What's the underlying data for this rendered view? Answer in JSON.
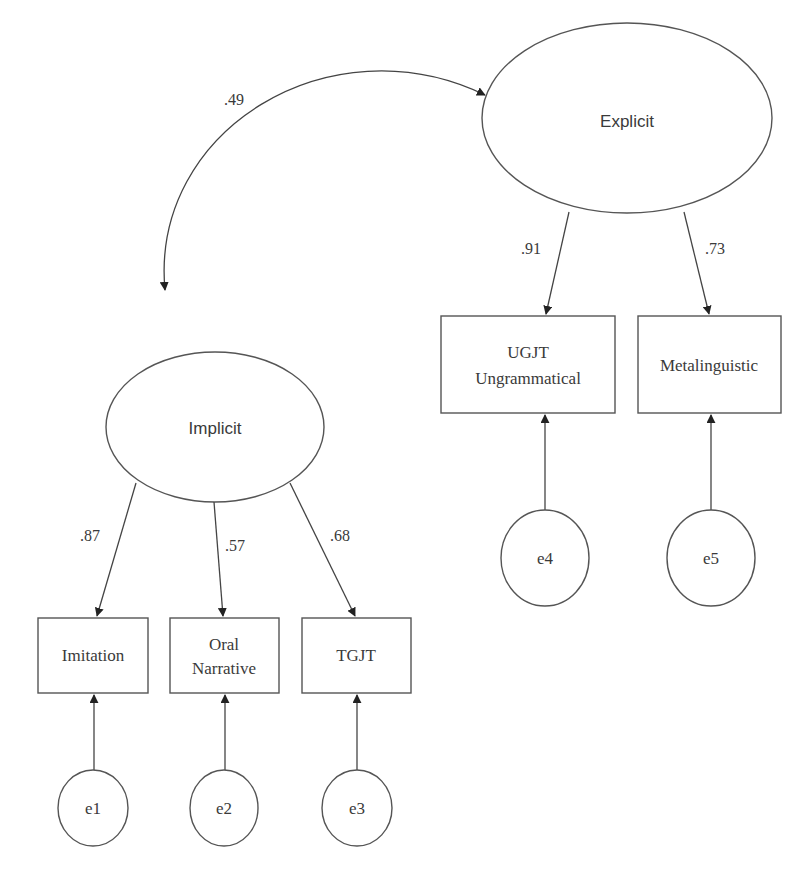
{
  "diagram": {
    "type": "structural-equation-model",
    "latents": [
      {
        "id": "explicit",
        "label": "Explicit"
      },
      {
        "id": "implicit",
        "label": "Implicit"
      }
    ],
    "covariance": {
      "from": "implicit",
      "to": "explicit",
      "value": ".49"
    },
    "observed": [
      {
        "id": "imitation",
        "lines": [
          "Imitation"
        ],
        "factor": "implicit",
        "loading": ".87",
        "error": "e1"
      },
      {
        "id": "oral-narrative",
        "lines": [
          "Oral",
          "Narrative"
        ],
        "factor": "implicit",
        "loading": ".57",
        "error": "e2"
      },
      {
        "id": "tgjt",
        "lines": [
          "TGJT"
        ],
        "factor": "implicit",
        "loading": ".68",
        "error": "e3"
      },
      {
        "id": "ugjt",
        "lines": [
          "UGJT",
          "Ungrammatical"
        ],
        "factor": "explicit",
        "loading": ".91",
        "error": "e4"
      },
      {
        "id": "metalinguistic",
        "lines": [
          "Metalinguistic"
        ],
        "factor": "explicit",
        "loading": ".73",
        "error": "e5"
      }
    ]
  }
}
